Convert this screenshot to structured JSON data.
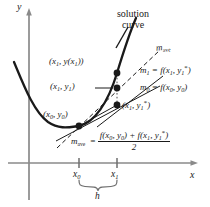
{
  "figure": {
    "type": "math-diagram",
    "background_color": "#ffffff",
    "ink_color": "#1a1a1a",
    "width": 210,
    "height": 207
  },
  "axes": {
    "y_label": "y",
    "x_label": "x",
    "ticks": [
      {
        "id": "x0",
        "base": "x",
        "sub": "0",
        "x_px": 79
      },
      {
        "id": "x1",
        "base": "x",
        "sub": "1",
        "x_px": 117
      }
    ]
  },
  "curve": {
    "label_line1": "solution",
    "label_line2": "curve",
    "description": "upward-opening solution curve passing through the plotted points"
  },
  "points": [
    {
      "name": "exact-solution-point",
      "label_prefix": "(",
      "base1": "x",
      "sub1": "1",
      "mid": ", ",
      "base2": "y",
      "inner": "(x",
      "inner_sub": "1",
      "label_text": "(x1, y(x1))",
      "x_px": 117,
      "y_px": 73
    },
    {
      "name": "improved-euler-point",
      "label_text": "(x1, y1)",
      "x_px": 117,
      "y_px": 88
    },
    {
      "name": "euler-predictor-point",
      "label_text": "(x1, y1*)",
      "x_px": 117,
      "y_px": 105
    },
    {
      "name": "initial-point",
      "label_text": "(x0, y0)",
      "x_px": 79,
      "y_px": 126
    }
  ],
  "slopes": {
    "m_ave_line_label": {
      "base": "m",
      "sub": "ave"
    },
    "m1": {
      "lhs_base": "m",
      "lhs_sub": "1",
      "eq": " = ",
      "fn": "f",
      "arg_open": "(",
      "arg1_base": "x",
      "arg1_sub": "1",
      "comma": ", ",
      "arg2_base": "y",
      "arg2_sub": "1",
      "arg2_star": "*",
      "arg_close": ")"
    },
    "m0": {
      "lhs_base": "m",
      "lhs_sub": "0",
      "eq": " = ",
      "fn": "f",
      "arg_open": "(",
      "arg1_base": "x",
      "arg1_sub": "0",
      "comma": ", ",
      "arg2_base": "y",
      "arg2_sub": "0",
      "arg_close": ")"
    }
  },
  "equation": {
    "lhs_base": "m",
    "lhs_sub": "ave",
    "eq": "=",
    "numerator": {
      "f1": "f",
      "n_open1": "(",
      "n_x0_base": "x",
      "n_x0_sub": "0",
      "n_comma1": ", ",
      "n_y0_base": "y",
      "n_y0_sub": "0",
      "n_close1": ")",
      "plus": " + ",
      "f2": "f",
      "n_open2": "(",
      "n_x1_base": "x",
      "n_x1_sub": "1",
      "n_comma2": ", ",
      "n_y1_base": "y",
      "n_y1_sub": "1",
      "n_star": "*",
      "n_close2": ")"
    },
    "denominator": "2"
  },
  "brace": {
    "label": "h",
    "spans_from_tick": "x0",
    "spans_to_tick": "x1"
  }
}
